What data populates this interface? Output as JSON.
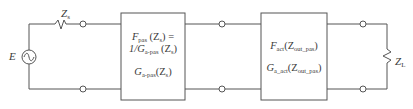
{
  "diagram": {
    "type": "two-port cascade circuit",
    "source": {
      "label": "E",
      "symbol": "ac-voltage-source"
    },
    "source_impedance": {
      "label": "Z",
      "subscript": "s"
    },
    "load_impedance": {
      "label": "Z",
      "subscript": "L"
    },
    "blocks": [
      {
        "id": "passive",
        "lines": [
          {
            "main": "F",
            "sub": "pas",
            "arg": " (Z",
            "arg_sub": "s",
            "tail": ") ="
          },
          {
            "main": "1/G",
            "sub": "a-pas",
            "arg": " (Z",
            "arg_sub": "s",
            "tail": ")"
          },
          {
            "main": "G",
            "sub": "a-pas",
            "arg": "(Z",
            "arg_sub": "s",
            "tail": ")"
          }
        ]
      },
      {
        "id": "active",
        "lines": [
          {
            "main": "F",
            "sub": "act",
            "arg": "(Z",
            "arg_sub": "out_pas",
            "tail": ")"
          },
          {
            "main": "G",
            "sub": "a_act",
            "arg": "(Z",
            "arg_sub": "out_pas",
            "tail": ")"
          }
        ]
      }
    ],
    "colors": {
      "line": "#555555",
      "text": "#3a3a3a",
      "background": "#ffffff"
    }
  }
}
